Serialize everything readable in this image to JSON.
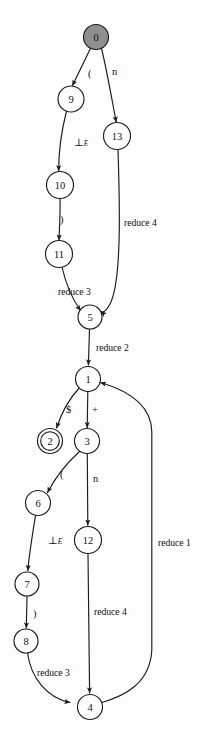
{
  "figure": {
    "width": 207,
    "height": 749,
    "background_color": "#fdfdfd",
    "stroke_color": "#1b1b1b",
    "start_node_fill": "#8f8f8f"
  },
  "nodes": [
    {
      "id": "0",
      "label": "0",
      "cx": 96,
      "cy": 37,
      "r": 12.5,
      "kind": "start"
    },
    {
      "id": "9",
      "label": "9",
      "cx": 71,
      "cy": 99,
      "r": 13.0,
      "kind": "normal"
    },
    {
      "id": "13",
      "label": "13",
      "cx": 117,
      "cy": 136,
      "r": 13.5,
      "kind": "normal"
    },
    {
      "id": "10",
      "label": "10",
      "cx": 60,
      "cy": 185,
      "r": 13.5,
      "kind": "normal"
    },
    {
      "id": "11",
      "label": "11",
      "cx": 59,
      "cy": 254,
      "r": 13.5,
      "kind": "normal"
    },
    {
      "id": "5",
      "label": "5",
      "cx": 90,
      "cy": 317,
      "r": 12.0,
      "kind": "normal"
    },
    {
      "id": "1",
      "label": "1",
      "cx": 88,
      "cy": 379,
      "r": 12.5,
      "kind": "normal"
    },
    {
      "id": "2",
      "label": "2",
      "cx": 50,
      "cy": 441,
      "r": 12.5,
      "kind": "accept"
    },
    {
      "id": "3",
      "label": "3",
      "cx": 87,
      "cy": 441,
      "r": 12.5,
      "kind": "normal"
    },
    {
      "id": "6",
      "label": "6",
      "cx": 38,
      "cy": 503,
      "r": 12.5,
      "kind": "normal"
    },
    {
      "id": "12",
      "label": "12",
      "cx": 88,
      "cy": 540,
      "r": 13.5,
      "kind": "normal"
    },
    {
      "id": "7",
      "label": "7",
      "cx": 27,
      "cy": 584,
      "r": 12.0,
      "kind": "normal"
    },
    {
      "id": "8",
      "label": "8",
      "cx": 26,
      "cy": 641,
      "r": 12.0,
      "kind": "normal"
    },
    {
      "id": "4",
      "label": "4",
      "cx": 90,
      "cy": 707,
      "r": 12.5,
      "kind": "normal"
    }
  ],
  "edges": [
    {
      "id": "e0-9",
      "from": "0",
      "to": "9",
      "label": "(",
      "label_x": 88,
      "label_y": 73,
      "style": "sym"
    },
    {
      "id": "e0-13",
      "from": "0",
      "to": "13",
      "label": "n",
      "label_x": 112,
      "label_y": 71,
      "style": "sym"
    },
    {
      "id": "e9-10",
      "from": "9",
      "to": "10",
      "label": "⊥E",
      "label_x": 74,
      "label_y": 142,
      "style": "sym-sub"
    },
    {
      "id": "e10-11",
      "from": "10",
      "to": "11",
      "label": ")",
      "label_x": 60,
      "label_y": 219,
      "style": "sym"
    },
    {
      "id": "e11-5",
      "from": "11",
      "to": "5",
      "label": "reduce 3",
      "label_x": 58,
      "label_y": 291,
      "style": "word"
    },
    {
      "id": "e13-5",
      "from": "13",
      "to": "5",
      "label": "reduce 4",
      "label_x": 124,
      "label_y": 222,
      "style": "word"
    },
    {
      "id": "e5-1",
      "from": "5",
      "to": "1",
      "label": "reduce 2",
      "label_x": 96,
      "label_y": 347,
      "style": "word"
    },
    {
      "id": "e1-2",
      "from": "1",
      "to": "2",
      "label": "$",
      "label_x": 66,
      "label_y": 409,
      "style": "sym"
    },
    {
      "id": "e1-3",
      "from": "1",
      "to": "3",
      "label": "+",
      "label_x": 92,
      "label_y": 409,
      "style": "sym"
    },
    {
      "id": "e3-6",
      "from": "3",
      "to": "6",
      "label": "(",
      "label_x": 60,
      "label_y": 474,
      "style": "sym"
    },
    {
      "id": "e3-12",
      "from": "3",
      "to": "12",
      "label": "n",
      "label_x": 93,
      "label_y": 478,
      "style": "sym"
    },
    {
      "id": "e6-7",
      "from": "6",
      "to": "7",
      "label": "⊥E",
      "label_x": 48,
      "label_y": 540,
      "style": "sym-sub"
    },
    {
      "id": "e7-8",
      "from": "7",
      "to": "8",
      "label": ")",
      "label_x": 33,
      "label_y": 613,
      "style": "sym"
    },
    {
      "id": "e8-4",
      "from": "8",
      "to": "4",
      "label": "reduce 3",
      "label_x": 37,
      "label_y": 672,
      "style": "word"
    },
    {
      "id": "e12-4",
      "from": "12",
      "to": "4",
      "label": "reduce 4",
      "label_x": 94,
      "label_y": 611,
      "style": "word"
    },
    {
      "id": "e4-1",
      "from": "4",
      "to": "1",
      "label": "reduce 1",
      "label_x": 158,
      "label_y": 542,
      "style": "word"
    }
  ],
  "symbols": {
    "bottom_e_base": "⊥",
    "bottom_e_sub": "E"
  }
}
